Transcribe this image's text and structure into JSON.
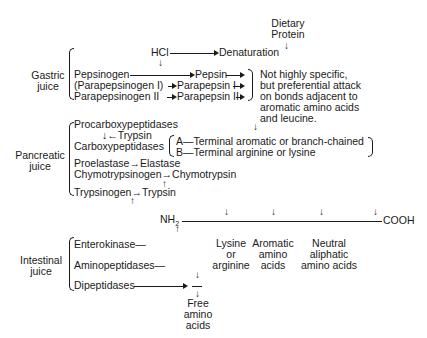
{
  "source": {
    "line1": "Dietary",
    "line2": "Protein"
  },
  "denaturation": {
    "hcl": "HCl",
    "result": "Denaturation"
  },
  "gastric": {
    "label_line1": "Gastric",
    "label_line2": "juice",
    "rows": [
      {
        "zymogen": "Pepsinogen",
        "enzyme": "Pepsin"
      },
      {
        "zymogen": "(Parapepsinogen I)",
        "enzyme": "Parapepsin I"
      },
      {
        "zymogen": "Parapepsinogen II",
        "enzyme": "Parapepsin II"
      }
    ],
    "specificity": [
      "Not highly specific,",
      "but preferential attack",
      "on bonds adjacent to",
      "aromatic amino acids",
      "and leucine."
    ]
  },
  "pancreatic": {
    "label_line1": "Pancreatic",
    "label_line2": "juice",
    "procarboxy": "Procarboxypeptidases",
    "trypsin_activator": "Trypsin",
    "carboxy": "Carboxypeptidases",
    "carboxy_types": [
      "A—Terminal aromatic or branch-chained",
      "B—Terminal arginine or lysine"
    ],
    "proelastase": "Proelastase",
    "elastase": "Elastase",
    "chymotrypsinogen": "Chymotrypsinogen",
    "chymotrypsin": "Chymotrypsin",
    "trypsinogen": "Trypsinogen",
    "trypsin": "Trypsin"
  },
  "peptide": {
    "n_terminus": "NH",
    "n_sub": "2",
    "c_terminus": "COOH",
    "sites": [
      {
        "line1": "Lysine",
        "line2": "or",
        "line3": "arginine"
      },
      {
        "line1": "Aromatic",
        "line2": "amino",
        "line3": "acids"
      },
      {
        "line1": "Neutral",
        "line2": "aliphatic",
        "line3": "amino acids"
      }
    ]
  },
  "intestinal": {
    "label_line1": "Intestinal",
    "label_line2": "juice",
    "enzymes": [
      "Enterokinase—",
      "Aminopeptidases—",
      "Dipeptidases"
    ]
  },
  "products": {
    "line1": "Free",
    "line2": "amino",
    "line3": "acids"
  }
}
